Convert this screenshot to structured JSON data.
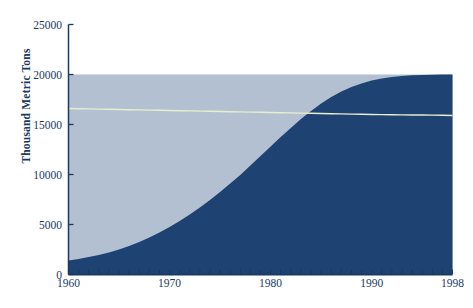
{
  "chart_data": {
    "type": "area",
    "title": "",
    "subtitle": "",
    "xlabel": "",
    "ylabel": "Thousand Metric Tons",
    "xlim": [
      1960,
      1998
    ],
    "ylim": [
      0,
      25000
    ],
    "grid": false,
    "legend_position": "none",
    "y_ticks": [
      0,
      5000,
      10000,
      15000,
      20000,
      25000
    ],
    "y_tick_labels": [
      "0",
      "5000",
      "10000",
      "15000",
      "20000",
      "25000"
    ],
    "x_ticks": [
      1960,
      1961,
      1962,
      1963,
      1964,
      1965,
      1966,
      1967,
      1968,
      1969,
      1970,
      1971,
      1972,
      1973,
      1974,
      1975,
      1976,
      1977,
      1978,
      1979,
      1980,
      1981,
      1982,
      1983,
      1984,
      1985,
      1986,
      1987,
      1988,
      1989,
      1990,
      1991,
      1992,
      1993,
      1994,
      1995,
      1996,
      1997,
      1998
    ],
    "x_tick_labels": [
      "1960",
      "1970",
      "1980",
      "1990",
      "1998"
    ],
    "x_labeled_ticks": [
      1960,
      1970,
      1980,
      1990,
      1998
    ],
    "colors": {
      "background_area": "#b2c0d2",
      "foreground_area": "#1e4272",
      "trend_line": "#e9eccd",
      "axis": "#1b3a63",
      "text": "#1b3a63",
      "page": "#ffffff"
    },
    "x": [
      1960,
      1961,
      1962,
      1963,
      1964,
      1965,
      1966,
      1967,
      1968,
      1969,
      1970,
      1971,
      1972,
      1973,
      1974,
      1975,
      1976,
      1977,
      1978,
      1979,
      1980,
      1981,
      1982,
      1983,
      1984,
      1985,
      1986,
      1987,
      1988,
      1989,
      1990,
      1991,
      1992,
      1993,
      1994,
      1995,
      1996,
      1997,
      1998
    ],
    "series": [
      {
        "name": "Total capacity",
        "kind": "area",
        "color": "#b2c0d2",
        "values": [
          20000,
          20000,
          20000,
          20000,
          20000,
          20000,
          20000,
          20000,
          20000,
          20000,
          20000,
          20000,
          20000,
          20000,
          20000,
          20000,
          20000,
          20000,
          20000,
          20000,
          20000,
          20000,
          20000,
          20000,
          20000,
          20000,
          20000,
          20000,
          20000,
          20000,
          20000,
          20000,
          20000,
          20000,
          20000,
          20000,
          20000,
          20000,
          20000
        ]
      },
      {
        "name": "Utilized",
        "kind": "area",
        "color": "#1e4272",
        "values": [
          1400,
          1550,
          1750,
          1950,
          2200,
          2500,
          2850,
          3250,
          3700,
          4200,
          4750,
          5350,
          6000,
          6700,
          7450,
          8250,
          9100,
          9950,
          10900,
          11850,
          12800,
          13750,
          14650,
          15550,
          16350,
          17100,
          17750,
          18300,
          18750,
          19100,
          19400,
          19600,
          19750,
          19850,
          19920,
          19960,
          19985,
          19995,
          20000
        ]
      },
      {
        "name": "Reference trend",
        "kind": "line",
        "color": "#e9eccd",
        "values": [
          16600,
          16580,
          16560,
          16540,
          16520,
          16500,
          16480,
          16460,
          16440,
          16420,
          16400,
          16380,
          16360,
          16340,
          16320,
          16300,
          16280,
          16260,
          16240,
          16220,
          16200,
          16180,
          16160,
          16140,
          16120,
          16100,
          16080,
          16060,
          16040,
          16020,
          16000,
          15990,
          15975,
          15965,
          15955,
          15945,
          15935,
          15925,
          15900
        ]
      }
    ],
    "annotations": []
  }
}
